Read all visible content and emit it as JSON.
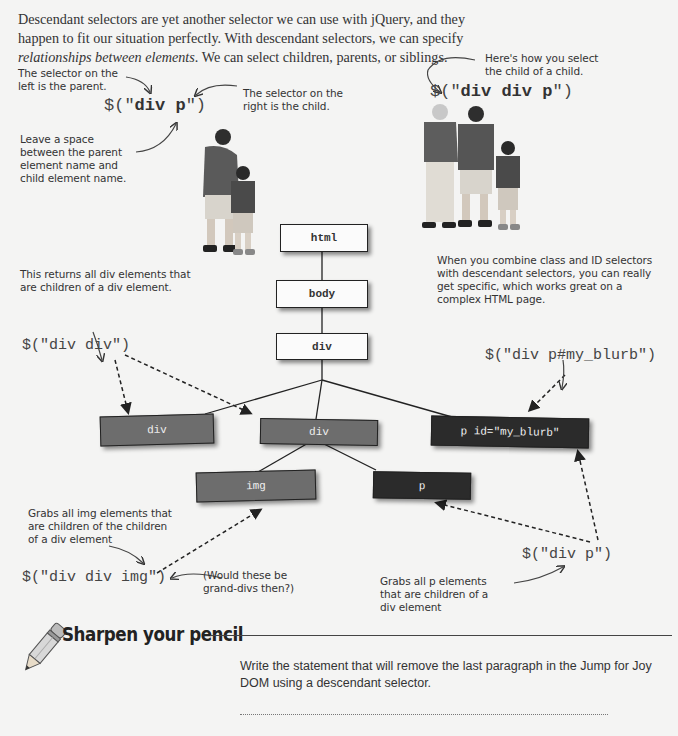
{
  "intro": {
    "line1": "Descendant selectors are yet another selector we can use with jQuery, and they",
    "line2": "happen to fit our situation perfectly. With descendant selectors, we can specify",
    "line3_italic": "relationships between elements",
    "line3_rest": ". We can select children, parents, or siblings."
  },
  "example_left": {
    "note_parent": [
      "The selector on the",
      "left is the parent."
    ],
    "note_child": [
      "The selector on the",
      "right is the child."
    ],
    "note_space": [
      "Leave a space",
      "between the parent",
      "element name and",
      "child element name."
    ],
    "selector_prefix": "$(\"",
    "selector_bold": "div p",
    "selector_suffix": "\")"
  },
  "example_right": {
    "note": [
      "Here's how you select",
      "the child of a child."
    ],
    "selector_prefix": "$(\"",
    "selector_bold": "div div p",
    "selector_suffix": "\")"
  },
  "dom_tree": {
    "nodes": {
      "html": "html",
      "body": "body",
      "div_root": "div",
      "div_left": "div",
      "div_center": "div",
      "p_blurb": "p id=\"my_blurb\"",
      "img": "img",
      "p": "p"
    },
    "colors": {
      "light": "#fbfbfb",
      "mid": "#6d6d6d",
      "dark": "#2b2b2b"
    }
  },
  "annotations": {
    "div_div_note": [
      "This returns all div elements that",
      "are children of a div element."
    ],
    "div_div_selector": "$(\"div div\")",
    "combine_note": [
      "When you combine class and ID selectors",
      "with descendant selectors, you can really",
      "get specific, which works great on a",
      "complex HTML page."
    ],
    "blurb_selector": "$(\"div p#my_blurb\")",
    "img_note": [
      "Grabs all img elements that",
      "are children of the children",
      "of a div element"
    ],
    "img_selector": "$(\"div div img\")",
    "grand_divs_note": [
      "(Would these be",
      "grand-divs then?)"
    ],
    "p_selector": "$(\"div p\")",
    "p_note": [
      "Grabs all p elements",
      "that are children of a",
      "div element"
    ]
  },
  "exercise": {
    "title": "Sharpen your pencil",
    "prompt_line1": "Write the statement that will remove the last paragraph in the Jump for Joy",
    "prompt_line2": "DOM using a descendant selector."
  }
}
